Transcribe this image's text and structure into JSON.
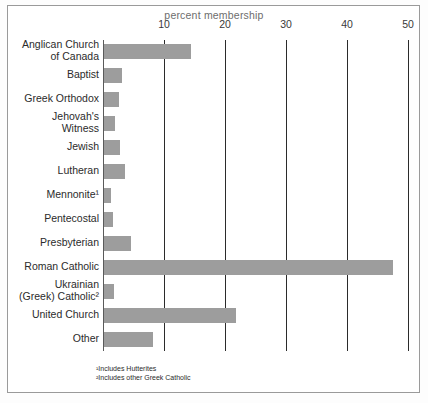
{
  "chart_data": {
    "type": "bar",
    "orientation": "horizontal",
    "title": "percent membership",
    "xlabel": "percent membership",
    "ylabel": "",
    "xlim": [
      0,
      50
    ],
    "xticks": [
      10,
      20,
      30,
      40,
      50
    ],
    "xtick_labels": [
      "10",
      "20",
      "30",
      "40",
      "50"
    ],
    "grid": true,
    "legend": false,
    "bar_color": "#9d9d9d",
    "categories": [
      "Anglican Church\nof Canada",
      "Baptist",
      "Greek Orthodox",
      "Jehovah's\nWitness",
      "Jewish",
      "Lutheran",
      "Mennonite¹",
      "Pentecostal",
      "Presbyterian",
      "Roman Catholic",
      "Ukrainian\n(Greek) Catholic²",
      "United Church",
      "Other"
    ],
    "values": [
      14.3,
      3.0,
      2.4,
      1.8,
      2.6,
      3.4,
      1.1,
      1.4,
      4.4,
      47.4,
      1.6,
      21.6,
      8.0
    ]
  },
  "footnotes": [
    "¹Includes Hutterites",
    "²Includes other Greek Catholic"
  ]
}
